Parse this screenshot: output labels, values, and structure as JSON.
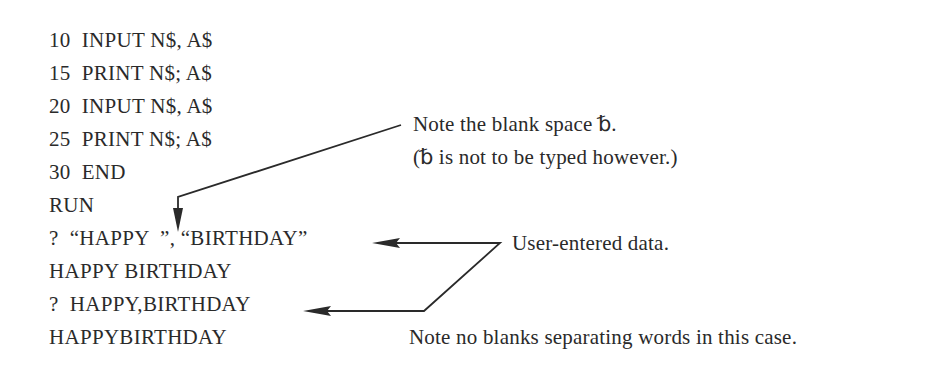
{
  "program": {
    "lines": [
      "10  INPUT N$, A$",
      "15  PRINT N$; A$",
      "20  INPUT N$, A$",
      "25  PRINT N$; A$",
      "30  END"
    ]
  },
  "output": {
    "lines": [
      "RUN",
      "?  “HAPPY  ”, “BIRTHDAY”",
      "HAPPY BIRTHDAY",
      "?  HAPPY,BIRTHDAY",
      "HAPPYBIRTHDAY"
    ]
  },
  "annotations": {
    "blank_space_note_line1": "Note the blank space ␢.",
    "blank_space_note_line2": "(␢ is not to be typed however.)",
    "user_entered_note": "User-entered data.",
    "no_blanks_note": "Note no blanks separating words in this case."
  },
  "colors": {
    "text": "#2a2a2a",
    "background": "#ffffff"
  }
}
